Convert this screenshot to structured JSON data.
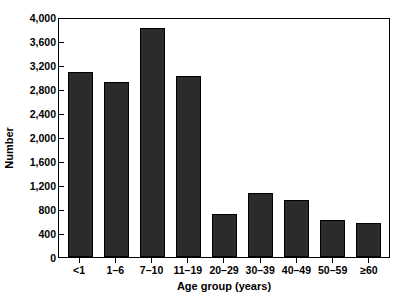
{
  "chart_data": {
    "type": "bar",
    "title": "",
    "xlabel": "Age group (years)",
    "ylabel": "Number",
    "categories": [
      "<1",
      "1–6",
      "7–10",
      "11–19",
      "20–29",
      "30–39",
      "40–49",
      "50–59",
      "≥60"
    ],
    "values": [
      3090,
      2920,
      3820,
      3020,
      720,
      1060,
      950,
      610,
      560
    ],
    "ylim": [
      0,
      4000
    ],
    "ytick_values": [
      0,
      400,
      800,
      1200,
      1600,
      2000,
      2400,
      2800,
      3200,
      3600,
      4000
    ],
    "ytick_labels": [
      "0",
      "400",
      "800",
      "1,200",
      "1,600",
      "2,000",
      "2,400",
      "2,800",
      "3,200",
      "3,600",
      "4,000"
    ],
    "grid": false,
    "legend": null,
    "bar_color": "#2b2b2b",
    "bar_edge_color": "#000000",
    "axis_color": "#000000",
    "background_color": "#ffffff"
  }
}
